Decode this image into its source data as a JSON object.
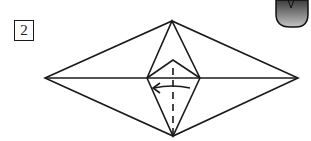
{
  "step": {
    "number": "2"
  },
  "diagram": {
    "colors": {
      "line": "#1a1a1a",
      "tab_fill_top": "#4a4a4a",
      "tab_fill_bottom": "#bdbdbd"
    }
  }
}
